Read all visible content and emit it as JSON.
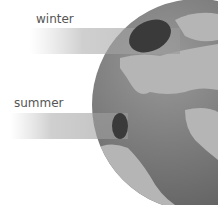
{
  "diagram": {
    "labels": {
      "winter": "winter",
      "summer": "summer"
    },
    "colors": {
      "globe": "#7a7a7a",
      "land": "#a8a8a8",
      "beam": "#9a9a9a",
      "spot": "#3a3a3a"
    }
  }
}
